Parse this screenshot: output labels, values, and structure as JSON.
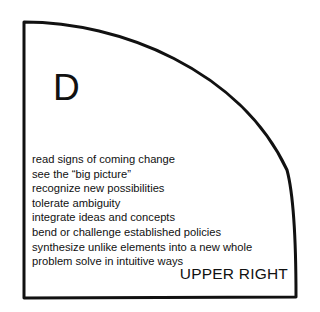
{
  "quadrant": {
    "letter": "D",
    "position_label": "UPPER RIGHT",
    "items": [
      "read signs of coming change",
      "see the “big picture”",
      "recognize new possibilities",
      "tolerate ambiguity",
      "integrate ideas and concepts",
      "bend or challenge established policies",
      "synthesize unlike elements into a new whole",
      "problem solve in intuitive ways"
    ],
    "stroke_color": "#111111",
    "background": "#ffffff"
  }
}
